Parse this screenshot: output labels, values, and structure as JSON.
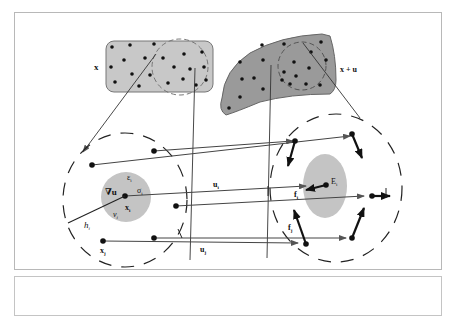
{
  "figure": {
    "reference_config_label": "x",
    "deformed_config_label": "x + u",
    "colors": {
      "body_reference": "#c8c8c8",
      "body_deformed": "#9a9a9a",
      "influence_zone": "#c4c4c4",
      "line": "#333333",
      "arrow": "#111111",
      "frame_border": "#b8b8b8"
    },
    "left_node": {
      "grad_label": "∇u",
      "strain_label": "ε",
      "strain_sub": "i",
      "stress_label": "σ",
      "stress_sub": "i",
      "volume_label": "v",
      "volume_sub": "i",
      "position_label": "x",
      "position_sub": "i",
      "horizon_label": "h",
      "horizon_sub": "i",
      "neighbor_label": "x",
      "neighbor_sub": "j"
    },
    "displacements": {
      "ui_label": "u",
      "ui_sub": "i",
      "uj_label": "u",
      "uj_sub": "j"
    },
    "right_node": {
      "energy_label": "E",
      "energy_sub": "i",
      "force_i_label": "f",
      "force_i_sub": "i",
      "force_j_label": "f",
      "force_j_sub": "j"
    }
  }
}
